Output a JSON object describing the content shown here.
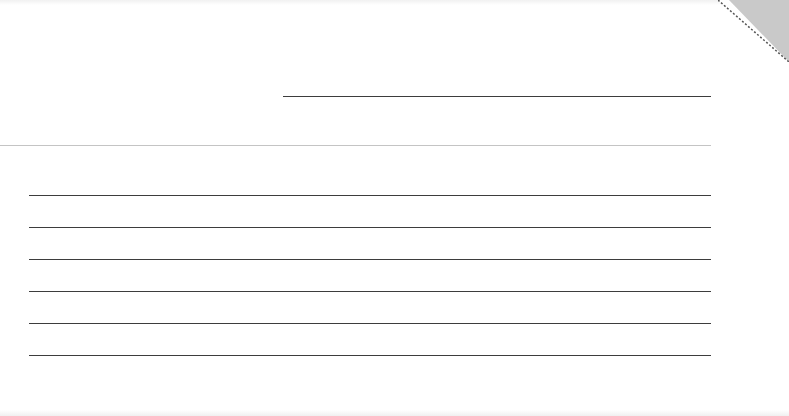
{
  "card": {
    "type": "blank lined card",
    "background_color": "#ffffff",
    "corner_color": "#c9c9c9",
    "line_color": "#3d3d3d",
    "divider_color": "#c4c4c4"
  },
  "header_field": {
    "label": "",
    "value": ""
  },
  "writing_lines": [
    {
      "value": ""
    },
    {
      "value": ""
    },
    {
      "value": ""
    },
    {
      "value": ""
    },
    {
      "value": ""
    },
    {
      "value": ""
    }
  ]
}
